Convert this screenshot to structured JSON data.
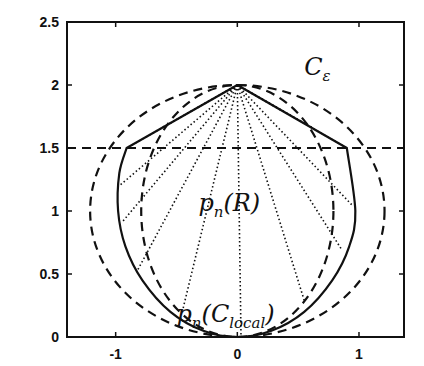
{
  "chart_data": {
    "type": "line",
    "title": "",
    "xlabel": "",
    "ylabel": "",
    "xlim": [
      -1.4,
      1.37
    ],
    "ylim": [
      0,
      2.5
    ],
    "grid": false,
    "legend": null,
    "x_ticks": [
      "-1",
      "0",
      "1"
    ],
    "x_tick_values": [
      -1,
      0,
      1
    ],
    "y_ticks": [
      "0",
      "0.5",
      "1",
      "1.5",
      "2",
      "2.5"
    ],
    "y_tick_values": [
      0,
      0.5,
      1,
      1.5,
      2,
      2.5
    ],
    "annotations": [
      {
        "id": "c-eps",
        "text": "C",
        "subscript": "ε",
        "x": 0.55,
        "y": 2.08
      },
      {
        "id": "pn-R",
        "text": "p",
        "subscript": "n",
        "suffix": "(R)",
        "x": -0.32,
        "y": 1.0
      },
      {
        "id": "pn-Clocal",
        "text": "p",
        "subscript": "n",
        "suffix": "(C",
        "suffix_sub": "local",
        "suffix_end": ")",
        "x": -0.5,
        "y": 0.12
      }
    ],
    "series": [
      {
        "name": "outer dashed circle (C_eps)",
        "style": "dashed",
        "shape": "ellipse",
        "center": [
          0,
          1.0
        ],
        "rx": 1.21,
        "ry": 1.0
      },
      {
        "name": "inner dashed circle",
        "style": "dashed",
        "shape": "ellipse",
        "center": [
          0,
          1.0
        ],
        "rx": 0.79,
        "ry": 1.0
      },
      {
        "name": "horizontal dashed line y=1.5",
        "style": "dashed",
        "x": [
          -1.4,
          1.37
        ],
        "y": [
          1.5,
          1.5
        ]
      },
      {
        "name": "solid boundary p_n(R)",
        "style": "solid",
        "x": [
          0,
          -0.91,
          -0.97,
          -0.98,
          -0.92,
          -0.78,
          -0.55,
          -0.28,
          0,
          0.28,
          0.55,
          0.78,
          0.92,
          0.97,
          0.9,
          0
        ],
        "y": [
          2,
          1.5,
          1.3,
          1.0,
          0.72,
          0.45,
          0.2,
          0.05,
          0,
          0.05,
          0.2,
          0.45,
          0.72,
          1.0,
          1.5,
          2
        ]
      },
      {
        "name": "dotted rays from apex (0,2)",
        "style": "dotted",
        "origin": [
          0,
          2
        ],
        "endpoints": [
          [
            -0.91,
            1.5
          ],
          [
            -0.97,
            1.2
          ],
          [
            -0.94,
            0.92
          ],
          [
            -0.82,
            0.53
          ],
          [
            -0.45,
            0.21
          ],
          [
            0.03,
            0.02
          ],
          [
            0.55,
            0.29
          ],
          [
            0.86,
            0.69
          ],
          [
            0.94,
            1.05
          ],
          [
            0.9,
            1.5
          ],
          [
            -0.62,
            1.66
          ],
          [
            0.62,
            1.66
          ]
        ]
      }
    ]
  }
}
